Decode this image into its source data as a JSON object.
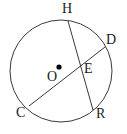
{
  "figure": {
    "kind": "circle-geometry-diagram",
    "background_color": "#ffffff",
    "stroke_color": "#3a3a3a",
    "label_color": "#1b1b1b",
    "center_dot_color": "#000000",
    "stroke_width": 1,
    "circle": {
      "center_x": 61,
      "center_y": 71,
      "radius": 51
    },
    "center_marker": {
      "x": 59,
      "y": 67,
      "r": 2.6
    },
    "chords": [
      {
        "name": "chord-HR",
        "from": "H",
        "to": "R",
        "x1": 68,
        "y1": 21,
        "x2": 93,
        "y2": 110
      },
      {
        "name": "chord-CD",
        "from": "C",
        "to": "D",
        "x1": 29,
        "y1": 106,
        "x2": 105,
        "y2": 47
      }
    ],
    "intersection": {
      "name": "E",
      "x": 80,
      "y": 67
    },
    "labels": [
      {
        "text": "H",
        "name": "point-label-h",
        "x": 62,
        "y": 2
      },
      {
        "text": "D",
        "name": "point-label-d",
        "x": 106,
        "y": 33
      },
      {
        "text": "E",
        "name": "point-label-e",
        "x": 84,
        "y": 62
      },
      {
        "text": "O",
        "name": "point-label-o",
        "x": 47,
        "y": 70
      },
      {
        "text": "R",
        "name": "point-label-r",
        "x": 96,
        "y": 107
      },
      {
        "text": "C",
        "name": "point-label-c",
        "x": 16,
        "y": 106
      }
    ]
  }
}
